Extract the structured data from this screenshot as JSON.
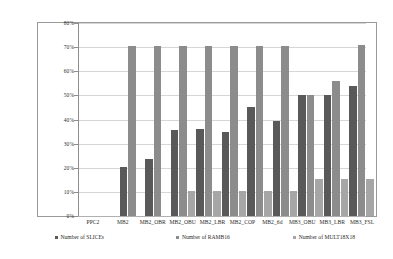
{
  "chart_data": {
    "type": "bar",
    "title": "",
    "subtitle": "",
    "xlabel": "",
    "ylabel": "",
    "ylim": [
      0,
      80
    ],
    "ytick_labels": [
      "80%",
      "70%",
      "60%",
      "50%",
      "40%",
      "30%",
      "20%",
      "10%",
      "0%"
    ],
    "ytick_values": [
      80,
      70,
      60,
      50,
      40,
      30,
      20,
      10,
      0
    ],
    "grid": true,
    "legend_position": "bottom",
    "categories": [
      "PPC2",
      "MB2",
      "MB2_OBR",
      "MB2_OBU",
      "MB2_LBR",
      "MB2_COP",
      "MB2_6d",
      "MB3_OBU",
      "MB3_LBR",
      "MB3_FSL"
    ],
    "series": [
      {
        "name": "Number of SLICEs",
        "color": "#595959",
        "values": [
          20.5,
          23.5,
          35.5,
          36,
          35,
          45,
          39.5,
          50,
          50,
          54
        ]
      },
      {
        "name": "Number of RAMB16",
        "color": "#8c8c8c",
        "values": [
          70.5,
          70.5,
          70.5,
          70.5,
          70.5,
          70.5,
          70.5,
          50,
          56,
          71
        ]
      },
      {
        "name": "Number of MULT18X18",
        "color": "#a6a6a6",
        "values": [
          0,
          0,
          10.5,
          10.5,
          10.5,
          10.5,
          10.5,
          15.5,
          15.5,
          15.5
        ]
      }
    ]
  },
  "colors": {
    "series_slices": "#595959",
    "series_ramb16": "#8c8c8c",
    "series_mult18x18": "#a6a6a6",
    "grid": "#d6d6d6",
    "axis": "#8e8e8e",
    "frame": "#9a9a9a",
    "background": "#ffffff",
    "text": "#2b2b2b"
  }
}
